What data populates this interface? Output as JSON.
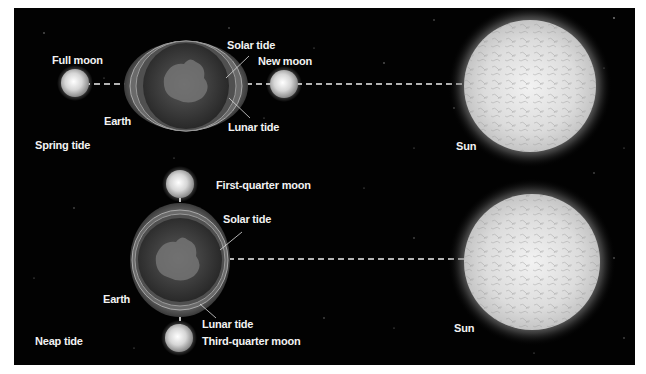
{
  "figure": {
    "background_color": "#020202",
    "label_color": "#f2f2f2",
    "spring": {
      "title": "Spring tide",
      "left_moon_label": "Full moon",
      "right_moon_label": "New moon",
      "earth_label": "Earth",
      "solar_tide_label": "Solar tide",
      "lunar_tide_label": "Lunar tide",
      "sun_label": "Sun"
    },
    "neap": {
      "title": "Neap tide",
      "top_moon_label": "First-quarter moon",
      "bottom_moon_label": "Third-quarter moon",
      "earth_label": "Earth",
      "solar_tide_label": "Solar tide",
      "lunar_tide_label": "Lunar tide",
      "sun_label": "Sun"
    }
  }
}
